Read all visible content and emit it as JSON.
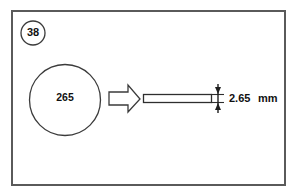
{
  "figure": {
    "number_badge": "38",
    "disc_label": "265",
    "dimension_value": "2.65",
    "dimension_unit": "mm",
    "arrow_icon_name": "block-arrow-right-icon",
    "colors": {
      "background": "#ffffff",
      "frame_stroke": "#5a5a5a",
      "line_stroke": "#3b3b3b",
      "dimension_stroke": "#1f1f1f",
      "text": "#111111"
    },
    "geometry": {
      "frame": {
        "x": 11,
        "y": 10,
        "width": 274,
        "height": 176
      },
      "badge_circle": {
        "cx": 33,
        "cy": 33,
        "r": 12
      },
      "disc_circle": {
        "cx": 65,
        "cy": 100,
        "r": 35.5
      },
      "bar": {
        "x": 143,
        "y": 94,
        "width": 69,
        "height": 8
      },
      "dimension_line_x": 218
    }
  }
}
